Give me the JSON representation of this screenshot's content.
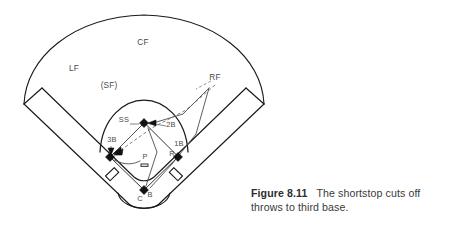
{
  "figure": {
    "caption_number": "Figure 8.11",
    "caption_text": "The shortstop cuts off throws to third base.",
    "background_color": "#ffffff",
    "line_color": "#1a1a1a",
    "arrow_color": "#555555"
  },
  "field": {
    "labels": {
      "center_field": "CF",
      "left_field": "LF",
      "short_field": "(SF)",
      "right_field": "RF",
      "shortstop": "SS",
      "third_base": "3B",
      "second_base": "2B",
      "first_base": "1B",
      "pitcher": "P",
      "runner": "R",
      "catcher": "C",
      "batter": "B"
    },
    "positions": [
      {
        "key": "center_field",
        "label": "CF",
        "x": 143,
        "y": 45
      },
      {
        "key": "left_field",
        "label": "LF",
        "x": 74,
        "y": 71
      },
      {
        "key": "short_field",
        "label": "(SF)",
        "x": 109,
        "y": 88
      },
      {
        "key": "right_field",
        "label": "RF",
        "x": 215,
        "y": 80
      },
      {
        "key": "shortstop",
        "label": "SS",
        "x": 124,
        "y": 122
      },
      {
        "key": "third_base",
        "label": "3B",
        "x": 112,
        "y": 142
      },
      {
        "key": "second_base",
        "label": "2B",
        "x": 171,
        "y": 127
      },
      {
        "key": "first_base",
        "label": "1B",
        "x": 179,
        "y": 146
      },
      {
        "key": "pitcher",
        "label": "P",
        "x": 145,
        "y": 159
      },
      {
        "key": "runner",
        "label": "R",
        "x": 172,
        "y": 156
      },
      {
        "key": "catcher",
        "label": "C",
        "x": 140,
        "y": 200
      },
      {
        "key": "batter",
        "label": "B",
        "x": 150,
        "y": 196
      }
    ],
    "bases": [
      {
        "name": "second-base",
        "x": 144,
        "y": 123
      },
      {
        "name": "third-base",
        "x": 110,
        "y": 157
      },
      {
        "name": "first-base",
        "x": 178,
        "y": 157
      },
      {
        "name": "home-plate",
        "x": 144,
        "y": 190
      }
    ]
  }
}
